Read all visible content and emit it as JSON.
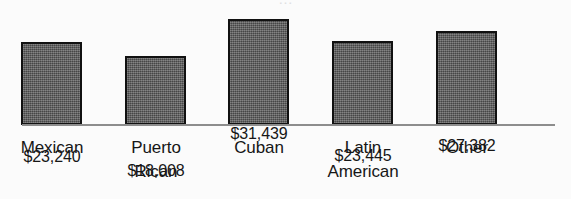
{
  "title_remnant": "…",
  "background_color": "#fbfbfb",
  "bar_fill_color": "#595959",
  "bar_outline_color": "#111111",
  "axis_color": "#8d8d8d",
  "text_color": "#161616",
  "chart_data": {
    "type": "bar",
    "title": "",
    "xlabel": "",
    "ylabel": "",
    "grid": false,
    "legend": "none",
    "ylim": [
      0,
      31439
    ],
    "categories": [
      "Mexican",
      "Puerto Rican",
      "Cuban",
      "Latin American",
      "Other"
    ],
    "category_lines": [
      [
        "Mexican"
      ],
      [
        "Puerto",
        "Rican"
      ],
      [
        "Cuban"
      ],
      [
        "Latin",
        "American"
      ],
      [
        "Other"
      ]
    ],
    "values": [
      23240,
      18008,
      31439,
      23445,
      27382
    ],
    "value_labels": [
      "$23,240",
      "$18,008",
      "$31,439",
      "$23,445",
      "$27,382"
    ]
  }
}
